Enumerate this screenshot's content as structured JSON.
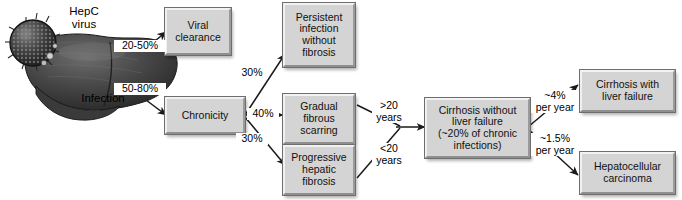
{
  "figure": {
    "type": "flowchart",
    "background_color": "#ffffff",
    "box_fill_color": "#d4d4d4",
    "box_border_color": "#6e6e6e",
    "line_color": "#1a1a1a"
  },
  "illustration": {
    "virus_label": "HepC\nvirus",
    "organ_label": "Infection",
    "virus_name": "hepatitis-c-virus-particle",
    "organ_name": "liver-organ"
  },
  "nodes": [
    {
      "id": "viral_clearance",
      "label": "Viral\nclearance"
    },
    {
      "id": "chronicity",
      "label": "Chronicity"
    },
    {
      "id": "persistent_infection",
      "label": "Persistent\ninfection\nwithout\nfibrosis"
    },
    {
      "id": "gradual_fibrous",
      "label": "Gradual\nfibrous\nscarring"
    },
    {
      "id": "progressive_fibrosis",
      "label": "Progressive\nhepatic\nfibrosis"
    },
    {
      "id": "cirrhosis_no_failure",
      "label": "Cirrhosis without\nliver failure\n(~20% of chronic\ninfections)"
    },
    {
      "id": "cirrhosis_with_failure",
      "label": "Cirrhosis with\nliver failure"
    },
    {
      "id": "hepatocellular",
      "label": "Hepatocellular\ncarcinoma"
    }
  ],
  "edge_labels": [
    {
      "id": "infection_to_clearance",
      "text": "20-50%"
    },
    {
      "id": "infection_to_chronicity",
      "text": "50-80%"
    },
    {
      "id": "chronicity_to_persistent",
      "text": "30%"
    },
    {
      "id": "chronicity_to_gradual",
      "text": "40%"
    },
    {
      "id": "chronicity_to_progressive",
      "text": "30%"
    },
    {
      "id": "gradual_to_cirrhosis",
      "text": ">20\nyears"
    },
    {
      "id": "progressive_to_cirrhosis",
      "text": "<20\nyears"
    },
    {
      "id": "cirrhosis_to_failure",
      "text": "~4%\nper year"
    },
    {
      "id": "cirrhosis_to_hcc",
      "text": "~1.5%\nper year"
    }
  ]
}
